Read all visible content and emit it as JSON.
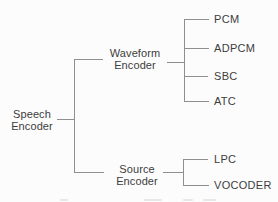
{
  "diagram": {
    "root": {
      "line1": "Speech",
      "line2": "Encoder"
    },
    "branches": [
      {
        "node": {
          "line1": "Waveform",
          "line2": "Encoder"
        },
        "leaves": [
          "PCM",
          "ADPCM",
          "SBC",
          "ATC"
        ]
      },
      {
        "node": {
          "line1": "Source",
          "line2": "Encoder"
        },
        "leaves": [
          "LPC",
          "VOCODER"
        ]
      }
    ]
  },
  "colors": {
    "background": "#fcfcfc",
    "line": "#8f8f8f",
    "text": "#3d3d3d"
  }
}
